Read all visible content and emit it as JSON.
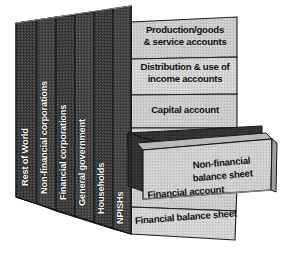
{
  "diagram": {
    "colors": {
      "sector_panel_fill": "#3b3b3b",
      "sector_panel_fill_alt": "#454545",
      "account_box_fill": "#c9c9c9",
      "account_box_fill_light": "#d2d2d2",
      "drawer_front_fill": "#cccccc",
      "drawer_interior_fill": "#2e2e2e",
      "drawer_top_fill": "#b9b9b9",
      "outline": "#1a1a1a",
      "sector_label_text": "#ffffff",
      "account_label_text": "#111111",
      "background": "#ffffff"
    },
    "sectors": [
      {
        "id": "rest-of-world",
        "label": "Rest of World"
      },
      {
        "id": "non-financial-corporations",
        "label": "Non-financial corporations"
      },
      {
        "id": "financial-corporations",
        "label": "Financial corporations"
      },
      {
        "id": "general-government",
        "label": "General government"
      },
      {
        "id": "households",
        "label": "Households"
      },
      {
        "id": "npishs",
        "label": "NPISHs"
      }
    ],
    "accounts": [
      {
        "id": "production-goods-service-accounts",
        "label": "Production/goods\n& service accounts"
      },
      {
        "id": "distribution-use-income-accounts",
        "label": "Distribution & use of\nincome accounts"
      },
      {
        "id": "capital-account",
        "label": "Capital account"
      },
      {
        "id": "financial-account",
        "label": "Financial account"
      },
      {
        "id": "financial-balance-sheet",
        "label": "Financial balance sheet"
      }
    ],
    "drawer": {
      "id": "non-financial-balance-sheet",
      "label": "Non-financial\nbalance sheet",
      "state": "pulled-out"
    }
  }
}
